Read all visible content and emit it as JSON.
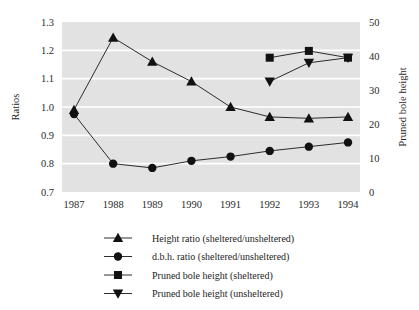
{
  "chart_data": {
    "type": "line",
    "title": "",
    "subtitle": "",
    "xlabel": "",
    "ylabel": "Ratios",
    "y2label": "Pruned bole height",
    "categories": [
      "1987",
      "1988",
      "1989",
      "1990",
      "1991",
      "1992",
      "1993",
      "1994"
    ],
    "x": [
      1987,
      1988,
      1989,
      1990,
      1991,
      1992,
      1993,
      1994
    ],
    "ylim": [
      0.7,
      1.3
    ],
    "y2lim": [
      0,
      50
    ],
    "yticks": [
      "0.7",
      "0.8",
      "0.9",
      "1.0",
      "1.1",
      "1.2",
      "1.3"
    ],
    "ytick_values": [
      0.7,
      0.8,
      0.9,
      1.0,
      1.1,
      1.2,
      1.3
    ],
    "y2ticks": [
      "0",
      "10",
      "20",
      "30",
      "40",
      "50"
    ],
    "y2tick_values": [
      0,
      10,
      20,
      30,
      40,
      50
    ],
    "grid": true,
    "grid_color": "#ffffff",
    "plot_background": "#e2e2e2",
    "legend_position": "bottom",
    "series": [
      {
        "name": "Height ratio (sheltered/unsheltered)",
        "marker": "triangle-up",
        "axis": "left",
        "color": "#111111",
        "x": [
          1987,
          1988,
          1989,
          1990,
          1991,
          1992,
          1993,
          1994
        ],
        "values": [
          0.99,
          1.245,
          1.16,
          1.09,
          1.0,
          0.965,
          0.96,
          0.965
        ]
      },
      {
        "name": "d.b.h. ratio (sheltered/unsheltered)",
        "marker": "circle",
        "axis": "left",
        "color": "#111111",
        "x": [
          1987,
          1988,
          1989,
          1990,
          1991,
          1992,
          1993,
          1994
        ],
        "values": [
          0.975,
          0.8,
          0.785,
          0.81,
          0.825,
          0.845,
          0.86,
          0.875
        ]
      },
      {
        "name": "Pruned bole height (sheltered)",
        "marker": "square",
        "axis": "right",
        "color": "#111111",
        "x": [
          1992,
          1993,
          1994
        ],
        "values": [
          39.5,
          41.5,
          39.5
        ]
      },
      {
        "name": "Pruned bole height (unsheltered)",
        "marker": "triangle-down",
        "axis": "right",
        "color": "#111111",
        "x": [
          1992,
          1993,
          1994
        ],
        "values": [
          32.5,
          38.0,
          39.5
        ]
      }
    ]
  },
  "legend": {
    "entries": [
      {
        "label": "Height ratio (sheltered/unsheltered)",
        "marker": "triangle-up"
      },
      {
        "label": "d.b.h. ratio (sheltered/unsheltered)",
        "marker": "circle"
      },
      {
        "label": "Pruned bole height (sheltered)",
        "marker": "square"
      },
      {
        "label": "Pruned bole height (unsheltered)",
        "marker": "triangle-down"
      }
    ]
  }
}
